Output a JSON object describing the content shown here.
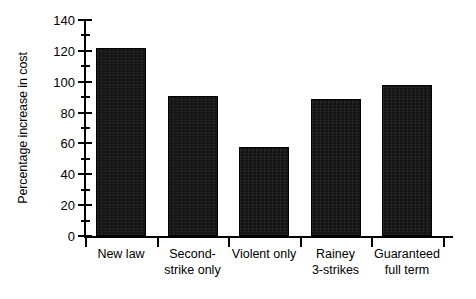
{
  "chart_data": {
    "type": "bar",
    "title": "",
    "xlabel": "",
    "ylabel": "Percentage increase in cost",
    "categories": [
      "New law",
      "Second-\nstrike only",
      "Violent only",
      "Rainey\n3-strikes",
      "Guaranteed\nfull term"
    ],
    "values": [
      122,
      91,
      58,
      89,
      98
    ],
    "ylim": [
      0,
      140
    ],
    "yticks": [
      0,
      20,
      40,
      60,
      80,
      100,
      120,
      140
    ],
    "ytick_labels": [
      "0",
      "20",
      "40",
      "60",
      "80",
      "100",
      "120",
      "140"
    ],
    "minor_tick_step": 10,
    "grid": false,
    "legend": null,
    "bar_color": "#141414",
    "axis_color": "#000000",
    "background": "#ffffff"
  }
}
